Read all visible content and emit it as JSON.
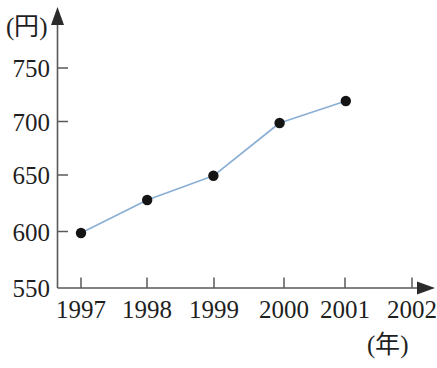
{
  "chart_data": {
    "type": "line",
    "title": "",
    "subtitle": "",
    "xlabel": "(年)",
    "ylabel": "(円)",
    "x": [
      1997,
      1998,
      1999,
      2000,
      2001
    ],
    "categories": [
      "1997",
      "1998",
      "1999",
      "2000",
      "2001"
    ],
    "values": [
      600,
      630,
      652,
      700,
      720
    ],
    "series": [
      {
        "name": "価格",
        "values": [
          600,
          630,
          652,
          700,
          720
        ]
      }
    ],
    "xlim": [
      1997,
      2002
    ],
    "ylim": [
      550,
      780
    ],
    "xticks": [
      "1997",
      "1998",
      "1999",
      "2000",
      "2001",
      "2002"
    ],
    "yticks": [
      "550",
      "600",
      "650",
      "700",
      "750"
    ],
    "ytick_values": [
      550,
      600,
      650,
      700,
      750
    ],
    "grid": false,
    "legend": false,
    "legend_position": "none",
    "annotations": [],
    "line_color": "#8aaed4",
    "marker_color": "#141414",
    "axis_color": "#595959"
  },
  "axes": {
    "y_unit_label": "(円)",
    "x_unit_label": "(年)"
  },
  "ytick_labels": [
    "750",
    "700",
    "650",
    "600",
    "550"
  ],
  "xtick_labels": [
    "1997",
    "1998",
    "1999",
    "2000",
    "2001",
    "2002"
  ],
  "icons": {
    "y_axis_arrow": "arrow-up-icon",
    "x_axis_arrow": "arrow-right-icon"
  }
}
